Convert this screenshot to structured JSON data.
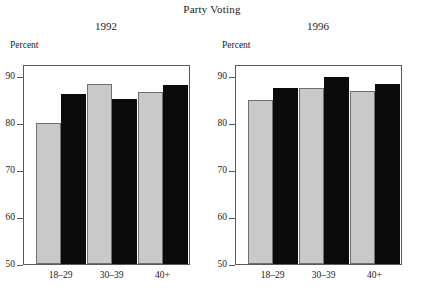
{
  "chart_data": {
    "type": "bar",
    "title": "Party Voting",
    "ylabel": "Percent",
    "xlabel": "",
    "ylim": [
      50,
      92.5
    ],
    "yticks": [
      50,
      60,
      70,
      80,
      90
    ],
    "grid": false,
    "legend": "none",
    "categories": [
      "18–29",
      "30–39",
      "40+"
    ],
    "panels": [
      {
        "title": "1992",
        "ylabel": "Percent",
        "series": [
          {
            "name": "light",
            "color": "#c9c9c9",
            "values": [
              80.0,
              88.2,
              86.6
            ]
          },
          {
            "name": "dark",
            "color": "#0b0b0b",
            "values": [
              86.1,
              85.0,
              88.1
            ]
          }
        ]
      },
      {
        "title": "1996",
        "ylabel": "Percent",
        "series": [
          {
            "name": "light",
            "color": "#c9c9c9",
            "values": [
              84.8,
              87.3,
              86.7
            ]
          },
          {
            "name": "dark",
            "color": "#0b0b0b",
            "values": [
              87.3,
              89.8,
              88.3
            ]
          }
        ]
      }
    ]
  }
}
